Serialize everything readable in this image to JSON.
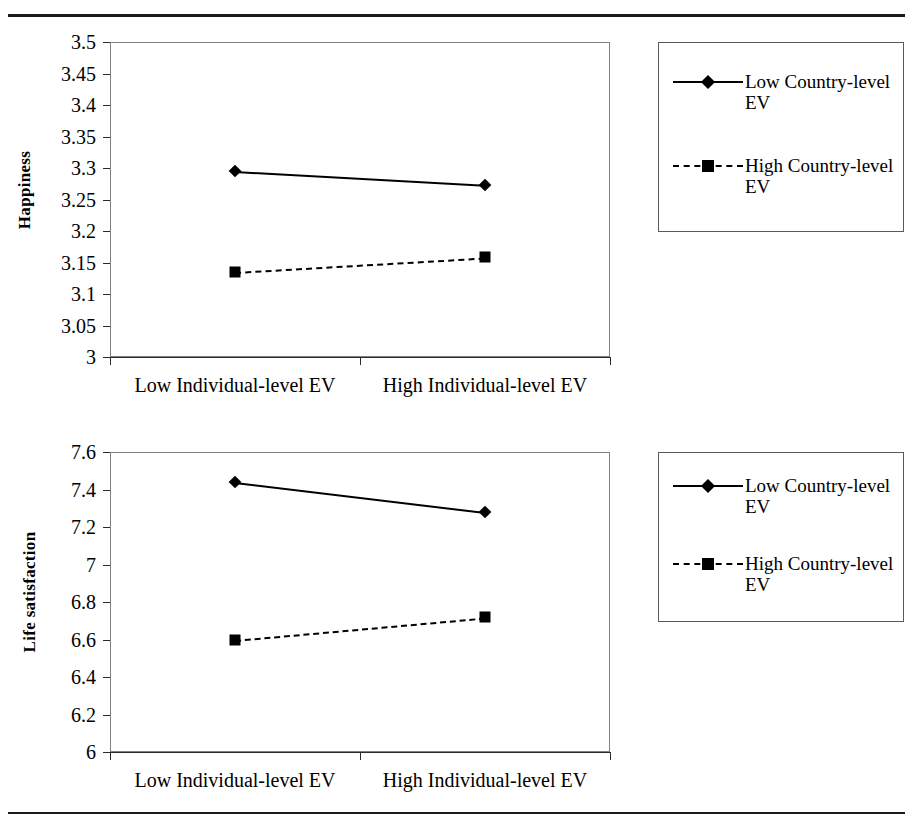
{
  "figure": {
    "top_divider": "horizontal-rule",
    "bottom_divider": "horizontal-rule"
  },
  "chart_data": [
    {
      "id": "happiness",
      "type": "line",
      "title": "",
      "xlabel": "",
      "ylabel": "Happiness",
      "categories": [
        "Low Individual-level EV",
        "High Individual-level EV"
      ],
      "ylim": [
        3,
        3.5
      ],
      "ytick_step": 0.05,
      "yticks": [
        "3.5",
        "3.45",
        "3.4",
        "3.35",
        "3.3",
        "3.25",
        "3.2",
        "3.15",
        "3.1",
        "3.05",
        "3"
      ],
      "grid": false,
      "legend_position": "right",
      "series": [
        {
          "name": "Low Country-level EV",
          "values": [
            3.295,
            3.273
          ],
          "style": "solid",
          "marker": "diamond",
          "color": "#000000"
        },
        {
          "name": "High Country-level EV",
          "values": [
            3.135,
            3.158
          ],
          "style": "dashed",
          "marker": "square",
          "color": "#000000"
        }
      ]
    },
    {
      "id": "life-satisfaction",
      "type": "line",
      "title": "",
      "xlabel": "",
      "ylabel": "Life satisfaction",
      "categories": [
        "Low Individual-level EV",
        "High Individual-level EV"
      ],
      "ylim": [
        6,
        7.6
      ],
      "ytick_step": 0.2,
      "yticks": [
        "7.6",
        "7.4",
        "7.2",
        "7",
        "6.8",
        "6.6",
        "6.4",
        "6.2",
        "6"
      ],
      "grid": false,
      "legend_position": "right",
      "series": [
        {
          "name": "Low Country-level EV",
          "values": [
            7.44,
            7.28
          ],
          "style": "solid",
          "marker": "diamond",
          "color": "#000000"
        },
        {
          "name": "High Country-level EV",
          "values": [
            6.6,
            6.72
          ],
          "style": "dashed",
          "marker": "square",
          "color": "#000000"
        }
      ]
    }
  ]
}
